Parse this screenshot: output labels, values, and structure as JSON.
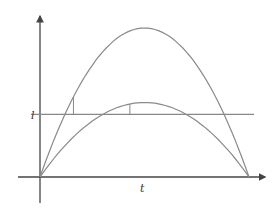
{
  "diagram": {
    "labels": {
      "y_level": "l",
      "x_axis": "t"
    },
    "curves": [
      {
        "name": "tall-parabola",
        "start": 0,
        "end": 1,
        "peak_height": 1.0
      },
      {
        "name": "short-parabola",
        "start": 0,
        "end": 1,
        "peak_height": 0.5
      }
    ],
    "level_line": 0.42,
    "markers": [
      {
        "curve": "tall-parabola",
        "t": 0.16
      },
      {
        "curve": "short-parabola",
        "t": 0.43
      }
    ],
    "colors": {
      "axis": "#444444",
      "curve": "#8a8a8a"
    }
  }
}
